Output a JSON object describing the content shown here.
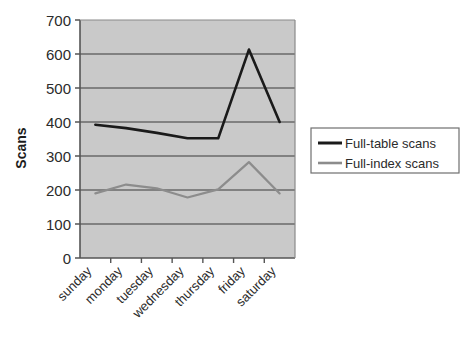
{
  "chart_data": {
    "type": "line",
    "title": "",
    "xlabel": "",
    "ylabel": "Scans",
    "categories": [
      "sunday",
      "monday",
      "tuesday",
      "wednesday",
      "thursday",
      "friday",
      "saturday"
    ],
    "series": [
      {
        "name": "Full-table scans",
        "color": "#1a1a1a",
        "values": [
          392,
          382,
          368,
          352,
          352,
          613,
          400
        ]
      },
      {
        "name": "Full-index scans",
        "color": "#8c8c8c",
        "values": [
          190,
          216,
          205,
          178,
          202,
          282,
          190
        ]
      }
    ],
    "ylim": [
      0,
      700
    ],
    "ytick_values": [
      0,
      100,
      200,
      300,
      400,
      500,
      600,
      700
    ],
    "ytick_labels": [
      "0",
      "100",
      "200",
      "300",
      "400",
      "500",
      "600",
      "700"
    ],
    "grid": "horizontal",
    "plot_background": "#c9c9c9",
    "figure_background": "#ffffff",
    "legend_position": "right",
    "legend_border": "#7a7a7a",
    "xtick_label_rotation": -45
  }
}
